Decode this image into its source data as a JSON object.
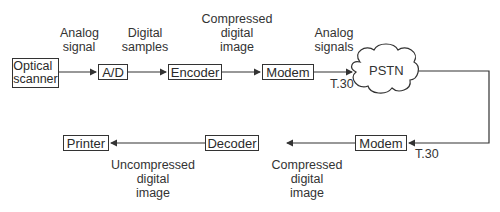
{
  "diagram": {
    "nodes": {
      "optical_scanner": "Optical scanner",
      "ad": "A/D",
      "encoder": "Encoder",
      "modem_tx": "Modem",
      "pstn": "PSTN",
      "modem_rx": "Modem",
      "decoder": "Decoder",
      "printer": "Printer"
    },
    "labels": {
      "analog_signal": "Analog\nsignal",
      "digital_samples": "Digital\nsamples",
      "compressed_tx": "Compressed\ndigital\nimage",
      "analog_signals": "Analog\nsignals",
      "t30_tx": "T.30",
      "t30_rx": "T.30",
      "compressed_rx": "Compressed\ndigital\nimage",
      "uncompressed": "Uncompressed\ndigital\nimage"
    },
    "edges": [
      [
        "optical_scanner",
        "ad"
      ],
      [
        "ad",
        "encoder"
      ],
      [
        "encoder",
        "modem_tx"
      ],
      [
        "modem_tx",
        "pstn"
      ],
      [
        "pstn",
        "modem_rx"
      ],
      [
        "modem_rx",
        "decoder"
      ],
      [
        "decoder",
        "printer"
      ]
    ]
  }
}
